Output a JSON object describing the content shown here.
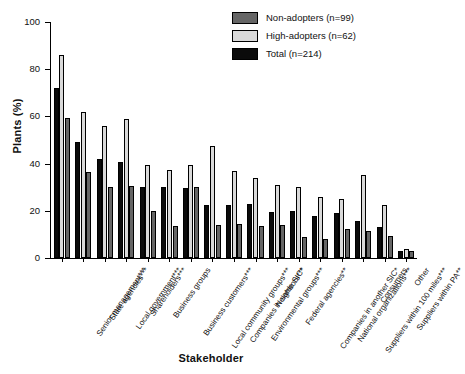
{
  "chart_data": {
    "type": "bar",
    "title": "",
    "xlabel": "Stakeholder",
    "ylabel": "Plants (%)",
    "ylim": [
      0,
      100
    ],
    "yticks": [
      0,
      20,
      40,
      60,
      80,
      100
    ],
    "grid": false,
    "legend_position": "top-right",
    "categories": [
      "Senior management***",
      "State agencies***",
      "Local government***",
      "Shareholders***",
      "Business groups",
      "Business customers***",
      "Local community groups***",
      "Companies in same SIC*",
      "Environmental groups***",
      "Neighbors***",
      "Federal agencies**",
      "Companies in another SIC*",
      "National organizations***",
      "Suppliers within 100 miles***",
      "Consumers",
      "Suppliers within PA**",
      "Other"
    ],
    "series": [
      {
        "name": "Total (n=214)",
        "key": "total",
        "color": "#0b0b0b",
        "values": [
          72,
          49,
          42,
          40.5,
          30,
          30,
          29.5,
          22.5,
          22.5,
          23,
          19.5,
          20,
          18,
          19,
          15.5,
          13,
          3
        ]
      },
      {
        "name": "High-adopters (n=62)",
        "key": "high",
        "color": "#d9d9d9",
        "values": [
          86,
          62,
          56,
          59,
          39.5,
          37.5,
          39.5,
          47.5,
          37,
          34,
          31,
          30,
          26,
          25,
          35,
          22.5,
          4
        ]
      },
      {
        "name": "Non-adopters (n=99)",
        "key": "non",
        "color": "#666666",
        "values": [
          59.5,
          36.5,
          30,
          30.5,
          20,
          13.5,
          30,
          14,
          14.5,
          13.5,
          14,
          9,
          8,
          12.5,
          11.5,
          9.5,
          3
        ]
      }
    ],
    "bar_order_in_group": [
      "total",
      "high",
      "non"
    ]
  },
  "legend": {
    "items": [
      {
        "label": "Non-adopters (n=99)",
        "swatch_name": "legend-swatch-non-adopters",
        "color": "#666666"
      },
      {
        "label": "High-adopters (n=62)",
        "swatch_name": "legend-swatch-high-adopters",
        "color": "#d9d9d9"
      },
      {
        "label": "Total (n=214)",
        "swatch_name": "legend-swatch-total",
        "color": "#0b0b0b"
      }
    ]
  }
}
